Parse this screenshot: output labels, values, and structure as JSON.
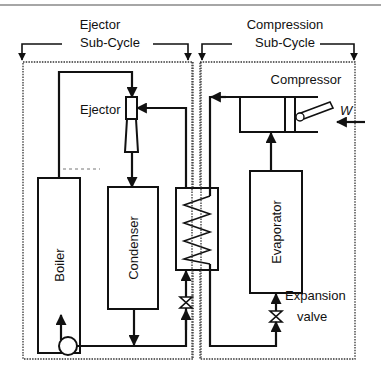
{
  "diagram": {
    "groups": [
      {
        "id": "ejector-subcycle",
        "label_line1": "Ejector",
        "label_line2": "Sub-Cycle"
      },
      {
        "id": "compression-subcycle",
        "label_line1": "Compression",
        "label_line2": "Sub-Cycle"
      }
    ],
    "components": {
      "ejector": "Ejector",
      "boiler": "Boiler",
      "condenser": "Condenser",
      "evaporator": "Evaporator",
      "compressor": "Compressor",
      "expansion_valve_line1": "Expansion",
      "expansion_valve_line2": "valve",
      "work_input": "W"
    },
    "unlabeled_components": [
      "pump",
      "heat-exchanger",
      "throttle-valve"
    ],
    "colors": {
      "line": "#111111",
      "boundary": "#333333",
      "background": "#ffffff"
    }
  }
}
